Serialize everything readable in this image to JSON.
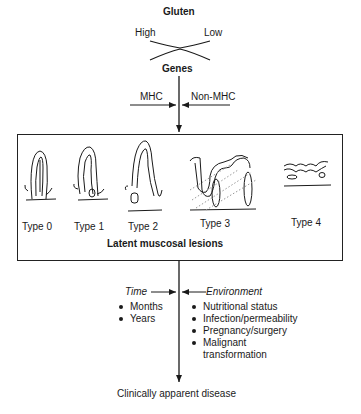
{
  "diagram": {
    "top": {
      "title": "Gluten",
      "left_label": "High",
      "right_label": "Low",
      "genes_label": "Genes",
      "mhc_label": "MHC",
      "non_mhc_label": "Non-MHC"
    },
    "lesions": {
      "types": [
        "Type 0",
        "Type 1",
        "Type 2",
        "Type 3",
        "Type 4"
      ],
      "caption": "Latent muscosal lesions"
    },
    "modifiers": {
      "time": {
        "label": "Time",
        "items": [
          "Months",
          "Years"
        ]
      },
      "environment": {
        "label": "Environment",
        "items": [
          "Nutritional status",
          "Infection/permeability",
          "Pregnancy/surgery",
          "Malignant transformation"
        ]
      }
    },
    "outcome": "Clinically apparent disease"
  }
}
